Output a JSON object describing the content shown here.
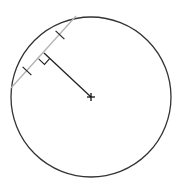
{
  "diagram": {
    "type": "geometry",
    "circle": {
      "cx": 91,
      "cy": 97,
      "r": 80,
      "stroke": "#333333"
    },
    "chord": {
      "x1": 11,
      "y1": 88,
      "x2": 76,
      "y2": 16,
      "stroke": "#b3b3b3"
    },
    "perpendicular": {
      "x1": 91,
      "y1": 97,
      "x2": 44,
      "y2": 53,
      "stroke": "#222222"
    },
    "center_marker": {
      "x": 91,
      "y": 97,
      "glyph": "plus"
    },
    "right_angle_marker": {
      "size": 8
    },
    "tick_marks": [
      {
        "x": 60,
        "y": 35
      },
      {
        "x": 27,
        "y": 71
      }
    ],
    "colors": {
      "circle": "#333333",
      "chord": "#b3b3b3",
      "segment": "#222222",
      "background": "#ffffff"
    }
  }
}
